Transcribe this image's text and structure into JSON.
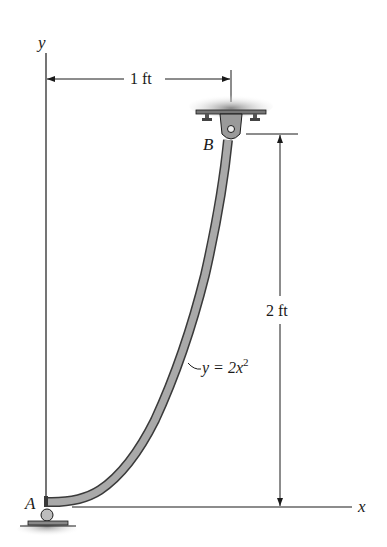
{
  "diagram": {
    "axes": {
      "y_label": "y",
      "x_label": "x"
    },
    "points": {
      "A": "A",
      "B": "B"
    },
    "dimensions": {
      "horizontal": "1 ft",
      "vertical": "2 ft"
    },
    "curve_equation": {
      "lhs": "y = 2x",
      "exponent": "2"
    },
    "colors": {
      "beam_fill": "#a9a9a9",
      "beam_edge": "#3a3a3a",
      "line": "#1a1a1a",
      "ground_shade": "#bdbdbd",
      "support_fill": "#9a9a9a"
    }
  }
}
